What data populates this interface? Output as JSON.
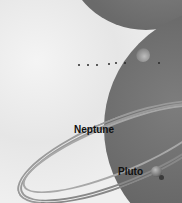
{
  "illustration": {
    "subject": "solar system planets illustration",
    "labels": {
      "neptune": "Neptune",
      "pluto": "Pluto"
    },
    "colors": {
      "background": "#ececec",
      "planet": "#666666",
      "label": "#111111"
    }
  }
}
